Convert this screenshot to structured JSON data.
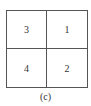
{
  "diagram": {
    "cells": [
      "3",
      "1",
      "4",
      "2"
    ],
    "caption": "(c)"
  }
}
